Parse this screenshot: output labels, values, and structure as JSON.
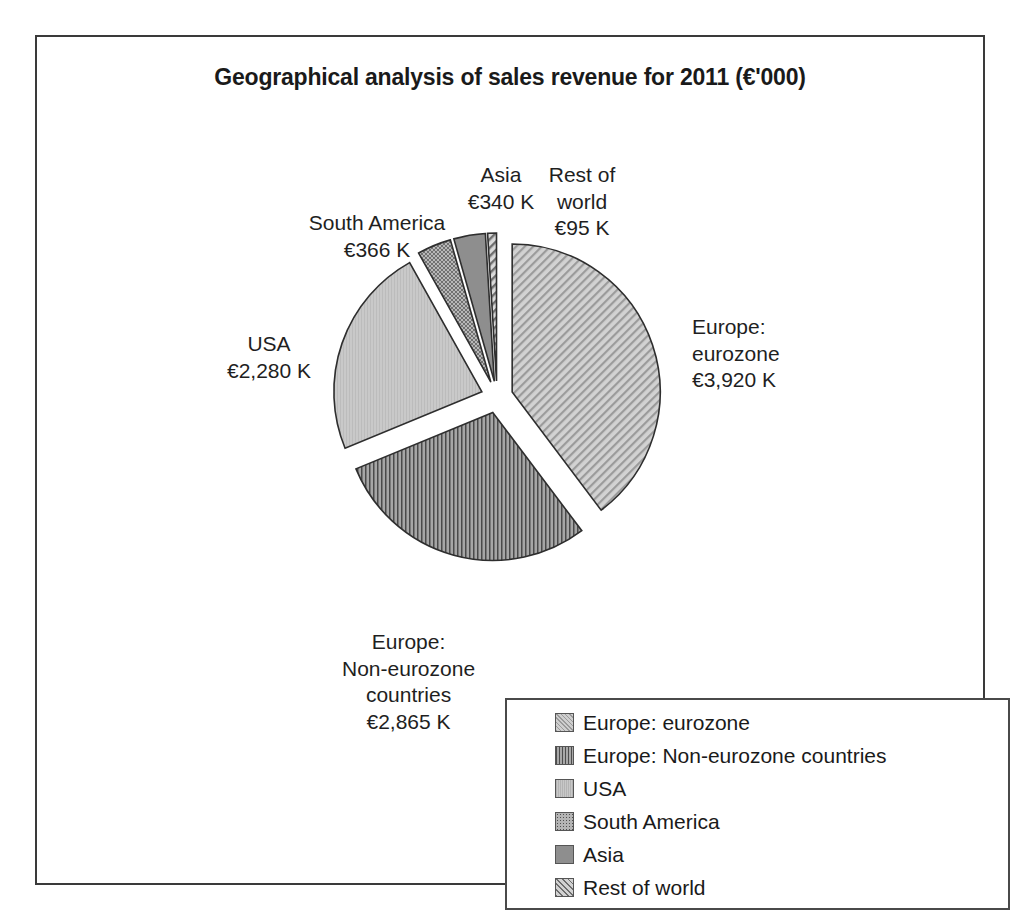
{
  "chart_data": {
    "type": "pie",
    "title": "Geographical analysis of sales revenue for 2011 (€'000)",
    "unit": "K",
    "currency": "€",
    "exploded": true,
    "start_angle_deg": 0,
    "direction": "clockwise",
    "legend_position": "bottom-right",
    "grid": false,
    "categories": [
      "Europe: eurozone",
      "Europe: Non-eurozone countries",
      "USA",
      "South America",
      "Asia",
      "Rest of world"
    ],
    "values": [
      3920,
      2865,
      2280,
      366,
      340,
      95
    ],
    "value_labels": [
      "€3,920 K",
      "€2,865 K",
      "€2,280 K",
      "€366 K",
      "€340 K",
      "€95 K"
    ],
    "total": 9866,
    "slice_fills": [
      "diagonal-hatch-light",
      "vertical-lines-dark",
      "solid-light-gray",
      "dotted-stipple-gray",
      "solid-dark-gray",
      "diagonal-hatch-thin"
    ],
    "slice_colors": [
      "#cfcfcf",
      "#a8a8a8",
      "#c8c8c8",
      "#b4b4b4",
      "#8e8e8e",
      "#d2d2d2"
    ]
  },
  "frame": {
    "border_color": "#3a3a3a"
  },
  "labels": {
    "eurozone": {
      "line1": "Europe:",
      "line2": "eurozone",
      "line3": "€3,920 K"
    },
    "noneurozone": {
      "line1": "Europe:",
      "line2": "Non-eurozone",
      "line3": "countries",
      "line4": "€2,865 K"
    },
    "usa": {
      "line1": "USA",
      "line2": "€2,280 K"
    },
    "southamerica": {
      "line1": "South America",
      "line2": "€366 K"
    },
    "asia": {
      "line1": "Asia",
      "line2": "€340 K"
    },
    "restofworld": {
      "line1": "Rest of",
      "line2": "world",
      "line3": "€95 K"
    }
  },
  "legend": {
    "items": [
      {
        "label": "Europe: eurozone",
        "swatch": "diagonal-hatch-light"
      },
      {
        "label": "Europe: Non-eurozone countries",
        "swatch": "vertical-lines-dark"
      },
      {
        "label": "USA",
        "swatch": "solid-light-gray"
      },
      {
        "label": "South America",
        "swatch": "dotted-stipple-gray"
      },
      {
        "label": "Asia",
        "swatch": "solid-dark-gray"
      },
      {
        "label": "Rest of world",
        "swatch": "diagonal-hatch-thin"
      }
    ]
  }
}
